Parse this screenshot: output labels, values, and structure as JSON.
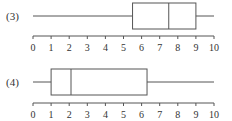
{
  "chart_data": [
    {
      "type": "boxplot",
      "label": "(3)",
      "min": 0,
      "q1": 5.5,
      "median": 7.5,
      "q3": 9,
      "max": 10,
      "axis": {
        "range": [
          0,
          10
        ],
        "ticks": [
          "0",
          "1",
          "2",
          "3",
          "4",
          "5",
          "6",
          "7",
          "8",
          "9",
          "10"
        ]
      }
    },
    {
      "type": "boxplot",
      "label": "(4)",
      "min": 0,
      "q1": 1,
      "median": 2.1,
      "q3": 6.3,
      "max": 10,
      "axis": {
        "range": [
          0,
          10
        ],
        "ticks": [
          "0",
          "1",
          "2",
          "3",
          "4",
          "5",
          "6",
          "7",
          "8",
          "9",
          "10"
        ]
      }
    }
  ],
  "colors": {
    "stroke": "#555555",
    "text": "#333333"
  }
}
